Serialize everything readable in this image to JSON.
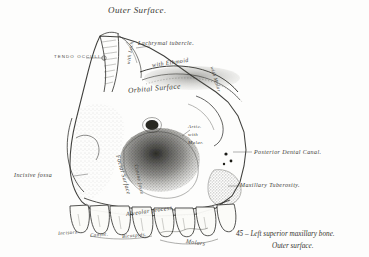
{
  "figure": {
    "title": "Outer  Surface.",
    "caption_line1": "45 – Left superior maxillary bone.",
    "caption_line2": "Outer surface."
  },
  "labels": {
    "tendo_oculi": "TENDO OCCULI",
    "lachrymal_tubercle": "Lachrymal tubercle.",
    "with_ethmoid": "with  Ethmoid",
    "with_lachrymal": "with Lach.",
    "orbital_surface": "Orbital  Surface",
    "with_malar": "with Malar",
    "artic_with_malar_1": "Artic.",
    "artic_with_malar_2": "with",
    "artic_with_malar_3": "Malar.",
    "posterior_dental_canal": "Posterior Dental Canal.",
    "maxillary_tuberosity": "Maxillary Tuberosity.",
    "incisive_fossa": "Incisive fossa",
    "facial_surface": "Facial  Surface",
    "canine_fossa": "Canine fossa",
    "alveolar_process": "Alveolar  process",
    "incisors": "Incisors.",
    "canine": "Canine.",
    "bicuspids": "Bicuspids.",
    "molars": "Molars"
  },
  "colors": {
    "ink": "#2b2b28",
    "paper": "#fdfdfc",
    "label_ink": "#3a3a35"
  }
}
